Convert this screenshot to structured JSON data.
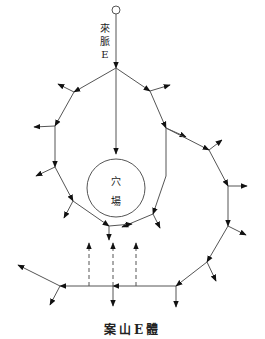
{
  "diagram": {
    "source_label": [
      "來",
      "脈",
      "E"
    ],
    "center_label": [
      "穴",
      "場"
    ],
    "caption": "案山E體",
    "colors": {
      "line": "#555555",
      "arrow": "#111111",
      "text": "#222222"
    },
    "source_node": {
      "x": 116,
      "y": 10,
      "r": 4
    },
    "hub": {
      "x": 116,
      "y": 68
    },
    "center_circle": {
      "cx": 116,
      "cy": 188,
      "r": 29
    },
    "ring_path": [
      [
        116,
        68
      ],
      [
        74,
        92
      ],
      [
        55,
        126
      ],
      [
        55,
        167
      ],
      [
        73,
        201
      ],
      [
        109,
        226
      ],
      [
        153,
        214
      ],
      [
        166,
        176
      ],
      [
        166,
        128
      ],
      [
        150,
        91
      ],
      [
        116,
        68
      ]
    ],
    "outer_path": [
      [
        166,
        128
      ],
      [
        209,
        150
      ],
      [
        228,
        186
      ],
      [
        228,
        226
      ],
      [
        207,
        262
      ],
      [
        176,
        286
      ],
      [
        60,
        286
      ],
      [
        14,
        260
      ]
    ],
    "dashed_arrows": [
      [
        89,
        286,
        89,
        245
      ],
      [
        113,
        286,
        113,
        245
      ],
      [
        136,
        286,
        136,
        245
      ]
    ]
  }
}
